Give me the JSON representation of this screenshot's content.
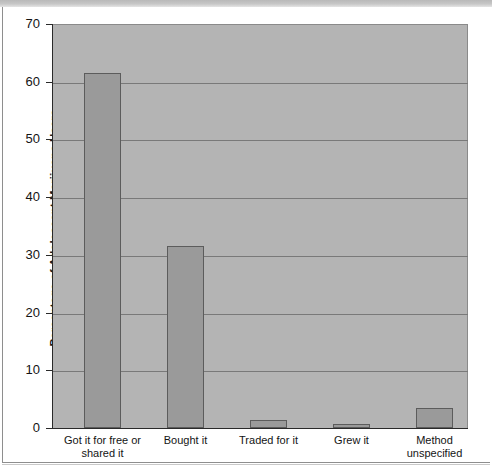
{
  "chart_data": {
    "type": "bar",
    "title": "",
    "xlabel": "",
    "ylabel": "Percentage of Adolescent Marijuana Users",
    "ylim": [
      0,
      70
    ],
    "ytick_step": 10,
    "yticks": [
      "70",
      "60",
      "50",
      "40",
      "30",
      "20",
      "10",
      "0"
    ],
    "grid": true,
    "legend": "none",
    "categories": [
      "Got it for free or shared it",
      "Bought it",
      "Traded for it",
      "Grew it",
      "Method unspecified"
    ],
    "category_lines": [
      [
        "Got it for free or",
        "shared it"
      ],
      [
        "Bought it"
      ],
      [
        "Traded for it"
      ],
      [
        "Grew it"
      ],
      [
        "Method",
        "unspecified"
      ]
    ],
    "values": [
      61.5,
      31.5,
      1.4,
      0.7,
      3.5
    ],
    "series": [
      {
        "name": "Percentage of Adolescent Marijuana Users",
        "values": [
          61.5,
          31.5,
          1.4,
          0.7,
          3.5
        ]
      }
    ]
  },
  "style": {
    "plot_background": "#b4b4b4",
    "bar_fill": "#9a9a9a",
    "bar_border": "#5c5c5c",
    "gridline_color": "#797979",
    "axis_color": "#2a2a2a",
    "text_color": "#141414",
    "page_background": "#ffffff"
  }
}
